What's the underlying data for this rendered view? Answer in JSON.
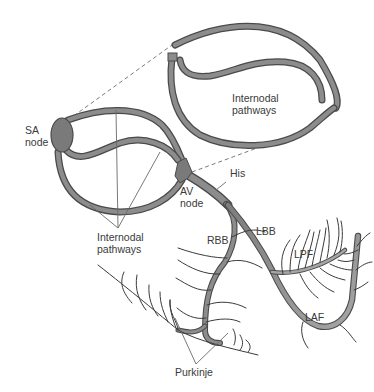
{
  "diagram": {
    "type": "cardiac-conduction-system",
    "colors": {
      "fiber_fill": "#8a8a8a",
      "fiber_outline": "#4a4a4a",
      "node_fill": "#7a7a7a",
      "leader_line": "#6a6a6a",
      "purkinje_line": "#3a3a3a",
      "text": "#3a3a3a",
      "background": "#ffffff"
    },
    "labels": {
      "sa_node": "SA\nnode",
      "av_node": "AV\nnode",
      "internodal_inset": "Internodal\npathways",
      "internodal_main": "Internodal\npathways",
      "his": "His",
      "lbb": "LBB",
      "rbb": "RBB",
      "lpf": "LPF",
      "laf": "LAF",
      "purkinje": "Purkinje"
    }
  }
}
